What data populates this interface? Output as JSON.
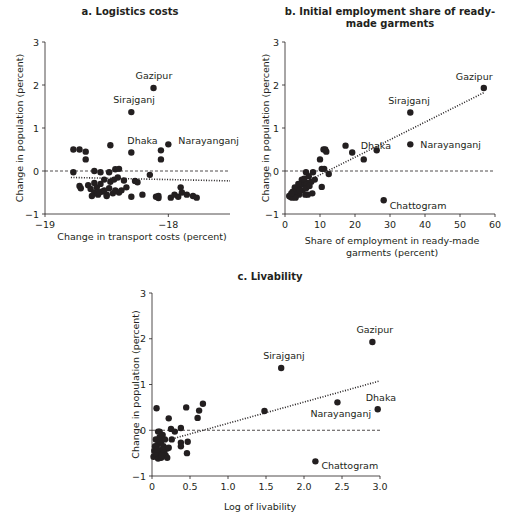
{
  "chart_data": [
    {
      "id": "a",
      "type": "scatter",
      "title": "a. Logistics costs",
      "xlabel": "Change in transport costs (percent)",
      "ylabel": "Change in population (percent)",
      "xlim": [
        -19,
        -17.5
      ],
      "ylim": [
        -1,
        3
      ],
      "xticks": [
        -19,
        -18
      ],
      "yticks": [
        -1,
        0,
        1,
        2,
        3
      ],
      "reference_line": {
        "y": 0,
        "style": "dashed"
      },
      "fit_line": {
        "style": "dotted",
        "x": [
          -18.79,
          -17.5
        ],
        "y": [
          -0.15,
          -0.23
        ]
      },
      "labeled_points": [
        {
          "name": "Gazipur",
          "x": -18.12,
          "y": 1.93
        },
        {
          "name": "Sirajganj",
          "x": -18.3,
          "y": 1.37
        },
        {
          "name": "Dhaka",
          "x": -18.3,
          "y": 0.43
        },
        {
          "name": "Narayanganj",
          "x": -18.0,
          "y": 0.62
        }
      ],
      "points": [
        [
          -18.77,
          0.5
        ],
        [
          -18.72,
          0.5
        ],
        [
          -18.67,
          0.45
        ],
        [
          -18.67,
          0.27
        ],
        [
          -18.6,
          0.0
        ],
        [
          -18.47,
          0.6
        ],
        [
          -18.06,
          0.48
        ],
        [
          -18.06,
          0.27
        ],
        [
          -18.77,
          -0.03
        ],
        [
          -18.55,
          -0.03
        ],
        [
          -18.48,
          -0.03
        ],
        [
          -18.43,
          0.04
        ],
        [
          -18.4,
          0.05
        ],
        [
          -18.27,
          -0.23
        ],
        [
          -18.25,
          -0.26
        ],
        [
          -18.15,
          -0.09
        ],
        [
          -18.72,
          -0.35
        ],
        [
          -18.71,
          -0.4
        ],
        [
          -18.65,
          -0.33
        ],
        [
          -18.63,
          -0.42
        ],
        [
          -18.6,
          -0.28
        ],
        [
          -18.6,
          -0.5
        ],
        [
          -18.58,
          -0.38
        ],
        [
          -18.57,
          -0.55
        ],
        [
          -18.55,
          -0.3
        ],
        [
          -18.54,
          -0.48
        ],
        [
          -18.52,
          -0.2
        ],
        [
          -18.5,
          -0.55
        ],
        [
          -18.48,
          -0.4
        ],
        [
          -18.47,
          -0.25
        ],
        [
          -18.45,
          -0.52
        ],
        [
          -18.44,
          -0.2
        ],
        [
          -18.43,
          -0.45
        ],
        [
          -18.41,
          -0.15
        ],
        [
          -18.4,
          -0.5
        ],
        [
          -18.38,
          -0.45
        ],
        [
          -18.36,
          -0.22
        ],
        [
          -18.34,
          -0.38
        ],
        [
          -18.3,
          -0.6
        ],
        [
          -18.21,
          -0.55
        ],
        [
          -18.1,
          -0.6
        ],
        [
          -18.08,
          -0.58
        ],
        [
          -17.98,
          -0.62
        ],
        [
          -17.95,
          -0.55
        ],
        [
          -17.92,
          -0.6
        ],
        [
          -17.89,
          -0.5
        ],
        [
          -17.85,
          -0.55
        ],
        [
          -17.8,
          -0.58
        ],
        [
          -17.77,
          -0.62
        ],
        [
          -17.9,
          -0.38
        ],
        [
          -18.08,
          -0.63
        ],
        [
          -18.62,
          -0.58
        ],
        [
          -18.56,
          -0.5
        ],
        [
          -18.5,
          -0.58
        ],
        [
          -18.52,
          -0.45
        ]
      ]
    },
    {
      "id": "b",
      "type": "scatter",
      "title": "b. Initial employment share of ready-made garments",
      "xlabel": "Share of employment in ready-made garments (percent)",
      "ylabel": "Change in population (percent)",
      "xlim": [
        0,
        60
      ],
      "ylim": [
        -1,
        3
      ],
      "xticks": [
        0,
        10,
        20,
        30,
        40,
        50,
        60
      ],
      "yticks": [
        -1,
        0,
        1,
        2,
        3
      ],
      "reference_line": {
        "y": 0,
        "style": "dashed"
      },
      "fit_line": {
        "style": "dotted",
        "x": [
          8,
          57
        ],
        "y": [
          -0.17,
          1.83
        ]
      },
      "labeled_points": [
        {
          "name": "Gazipur",
          "x": 56.8,
          "y": 1.93
        },
        {
          "name": "Sirajganj",
          "x": 35.8,
          "y": 1.36
        },
        {
          "name": "Dhaka",
          "x": 26.2,
          "y": 0.48
        },
        {
          "name": "Narayanganj",
          "x": 35.8,
          "y": 0.62
        },
        {
          "name": "Chattogram",
          "x": 28.2,
          "y": -0.68
        }
      ],
      "points": [
        [
          17.3,
          0.59
        ],
        [
          19.2,
          0.43
        ],
        [
          22.5,
          0.27
        ],
        [
          11.0,
          0.5
        ],
        [
          11.8,
          0.45
        ],
        [
          11.5,
          0.5
        ],
        [
          10.0,
          0.27
        ],
        [
          10.5,
          0.05
        ],
        [
          11.2,
          0.05
        ],
        [
          12.5,
          -0.07
        ],
        [
          10.5,
          -0.37
        ],
        [
          6.0,
          -0.03
        ],
        [
          8.0,
          -0.03
        ],
        [
          8.5,
          -0.2
        ],
        [
          7.5,
          -0.25
        ],
        [
          6.5,
          -0.28
        ],
        [
          5.5,
          -0.3
        ],
        [
          4.5,
          -0.32
        ],
        [
          4.0,
          -0.35
        ],
        [
          3.5,
          -0.4
        ],
        [
          3.0,
          -0.45
        ],
        [
          2.5,
          -0.5
        ],
        [
          2.0,
          -0.55
        ],
        [
          1.5,
          -0.6
        ],
        [
          1.2,
          -0.58
        ],
        [
          2.0,
          -0.62
        ],
        [
          3.0,
          -0.6
        ],
        [
          4.0,
          -0.55
        ],
        [
          5.0,
          -0.45
        ],
        [
          6.0,
          -0.4
        ],
        [
          7.0,
          -0.35
        ],
        [
          6.5,
          -0.55
        ],
        [
          7.8,
          -0.52
        ],
        [
          3.5,
          -0.5
        ],
        [
          2.8,
          -0.38
        ],
        [
          4.8,
          -0.2
        ],
        [
          5.5,
          -0.18
        ],
        [
          6.8,
          -0.12
        ],
        [
          3.0,
          -0.62
        ],
        [
          2.2,
          -0.48
        ],
        [
          1.8,
          -0.52
        ],
        [
          4.2,
          -0.45
        ],
        [
          5.8,
          -0.55
        ],
        [
          3.8,
          -0.3
        ]
      ]
    },
    {
      "id": "c",
      "type": "scatter",
      "title": "c. Livability",
      "xlabel": "Log of livability",
      "ylabel": "Change in population (percent)",
      "xlim": [
        0,
        3.0
      ],
      "ylim": [
        -1,
        3
      ],
      "xticks": [
        0,
        0.5,
        1.0,
        1.5,
        2.0,
        2.5,
        3.0
      ],
      "xtick_labels": [
        "0",
        "0.5",
        "1.0",
        "1.5",
        "2.0",
        "2.5",
        "3.0"
      ],
      "yticks": [
        -1,
        0,
        1,
        2,
        3
      ],
      "reference_line": {
        "y": 0,
        "style": "dashed"
      },
      "fit_line": {
        "style": "dotted",
        "x": [
          0.2,
          3.0
        ],
        "y": [
          -0.22,
          1.08
        ]
      },
      "labeled_points": [
        {
          "name": "Gazipur",
          "x": 2.9,
          "y": 1.93
        },
        {
          "name": "Sirajganj",
          "x": 1.7,
          "y": 1.36
        },
        {
          "name": "Dhaka",
          "x": 2.97,
          "y": 0.46
        },
        {
          "name": "Narayanganj",
          "x": 2.44,
          "y": 0.61
        },
        {
          "name": "Chattogram",
          "x": 2.15,
          "y": -0.68
        }
      ],
      "points": [
        [
          1.48,
          0.42
        ],
        [
          0.06,
          0.48
        ],
        [
          0.45,
          0.5
        ],
        [
          0.62,
          0.43
        ],
        [
          0.6,
          0.27
        ],
        [
          0.67,
          0.58
        ],
        [
          0.22,
          0.26
        ],
        [
          0.25,
          0.03
        ],
        [
          0.3,
          -0.03
        ],
        [
          0.38,
          0.05
        ],
        [
          0.26,
          -0.2
        ],
        [
          0.38,
          -0.27
        ],
        [
          0.38,
          -0.35
        ],
        [
          0.47,
          -0.25
        ],
        [
          0.46,
          -0.5
        ],
        [
          0.08,
          -0.03
        ],
        [
          0.1,
          -0.03
        ],
        [
          0.05,
          -0.2
        ],
        [
          0.08,
          -0.3
        ],
        [
          0.12,
          -0.25
        ],
        [
          0.15,
          -0.35
        ],
        [
          0.03,
          -0.45
        ],
        [
          0.06,
          -0.55
        ],
        [
          0.1,
          -0.5
        ],
        [
          0.14,
          -0.42
        ],
        [
          0.18,
          -0.55
        ],
        [
          0.2,
          -0.6
        ],
        [
          0.02,
          -0.58
        ],
        [
          0.08,
          -0.62
        ],
        [
          0.12,
          -0.6
        ],
        [
          0.17,
          -0.2
        ],
        [
          0.2,
          -0.4
        ],
        [
          0.04,
          -0.35
        ],
        [
          0.1,
          -0.15
        ],
        [
          0.14,
          -0.1
        ],
        [
          0.05,
          -0.5
        ],
        [
          0.16,
          -0.48
        ],
        [
          0.22,
          -0.38
        ],
        [
          0.07,
          -0.42
        ],
        [
          0.13,
          -0.55
        ]
      ]
    }
  ]
}
